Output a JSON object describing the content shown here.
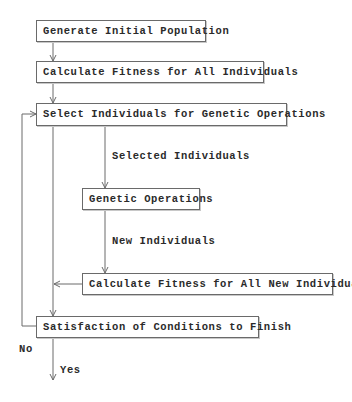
{
  "diagram": {
    "type": "flowchart",
    "nodes": {
      "generate": "Generate Initial Population",
      "calc_all": "Calculate Fitness for All Individuals",
      "select": "Select Individuals for Genetic Operations",
      "genetic": "Genetic Operations",
      "calc_new": "Calculate Fitness for All New Individuals",
      "satisfy": "Satisfaction of Conditions to Finish"
    },
    "edge_labels": {
      "selected": "Selected Individuals",
      "new": "New Individuals",
      "no": "No",
      "yes": "Yes"
    },
    "colors": {
      "line": "#6a6a6a",
      "text": "#2a2a2a",
      "background": "#ffffff"
    }
  }
}
